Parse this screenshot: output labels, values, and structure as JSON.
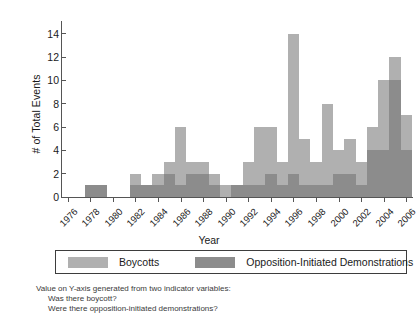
{
  "chart_data": {
    "type": "bar",
    "stacked": true,
    "title": "",
    "xlabel": "Year",
    "ylabel": "# of Total Events",
    "ylim": [
      0,
      15
    ],
    "yticks": [
      0,
      2,
      4,
      6,
      8,
      10,
      12,
      14
    ],
    "grid": false,
    "legend_position": "bottom",
    "x": [
      1976,
      1977,
      1978,
      1979,
      1980,
      1981,
      1982,
      1983,
      1984,
      1985,
      1986,
      1987,
      1988,
      1989,
      1990,
      1991,
      1992,
      1993,
      1994,
      1995,
      1996,
      1997,
      1998,
      1999,
      2000,
      2001,
      2002,
      2003,
      2004,
      2005,
      2006
    ],
    "categories": [
      "1976",
      "1977",
      "1978",
      "1979",
      "1980",
      "1981",
      "1982",
      "1983",
      "1984",
      "1985",
      "1986",
      "1987",
      "1988",
      "1989",
      "1990",
      "1991",
      "1992",
      "1993",
      "1994",
      "1995",
      "1996",
      "1997",
      "1998",
      "1999",
      "2000",
      "2001",
      "2002",
      "2003",
      "2004",
      "2005",
      "2006"
    ],
    "xtick_labels": [
      "1976",
      "1978",
      "1980",
      "1982",
      "1984",
      "1986",
      "1988",
      "1990",
      "1992",
      "1994",
      "1996",
      "1998",
      "2000",
      "2002",
      "2004",
      "2006"
    ],
    "series": [
      {
        "name": "Boycotts",
        "color": "#b0b0b0",
        "values": [
          0,
          0,
          0,
          0,
          0,
          0,
          1,
          0,
          1,
          1,
          5,
          1,
          1,
          1,
          1,
          0,
          2,
          5,
          4,
          2,
          12,
          4,
          2,
          7,
          2,
          3,
          2,
          2,
          6,
          2,
          3
        ]
      },
      {
        "name": "Opposition-Initiated Demonstrations",
        "color": "#8c8c8c",
        "values": [
          0,
          0,
          1,
          1,
          0,
          0,
          1,
          1,
          1,
          2,
          1,
          2,
          2,
          1,
          0,
          1,
          1,
          1,
          2,
          1,
          2,
          1,
          1,
          1,
          2,
          2,
          1,
          4,
          4,
          10,
          4
        ]
      }
    ],
    "totals": [
      0,
      0,
      1,
      1,
      0,
      0,
      2,
      1,
      2,
      3,
      6,
      3,
      3,
      2,
      1,
      1,
      3,
      6,
      6,
      3,
      14,
      5,
      3,
      8,
      4,
      5,
      3,
      6,
      10,
      12,
      7
    ]
  },
  "legend": {
    "entries": [
      {
        "label": "Boycotts",
        "color": "#b0b0b0"
      },
      {
        "label": "Opposition-Initiated Demonstrations",
        "color": "#8c8c8c"
      }
    ]
  },
  "footnote": {
    "line1": "Value on Y-axis generated from two indicator variables:",
    "line2": "Was there boycott?",
    "line3": "Were there opposition-initiated demonstrations?"
  }
}
